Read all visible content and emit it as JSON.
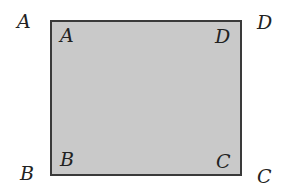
{
  "diagram": {
    "shape": "rectangle",
    "fill_color": "#c9c9c9",
    "stroke_color": "#3a3a3a",
    "outer_labels": {
      "top_left": "A",
      "top_right": "D",
      "bottom_left": "B",
      "bottom_right": "C"
    },
    "inner_labels": {
      "top_left": "A",
      "top_right": "D",
      "bottom_left": "B",
      "bottom_right": "C"
    }
  }
}
